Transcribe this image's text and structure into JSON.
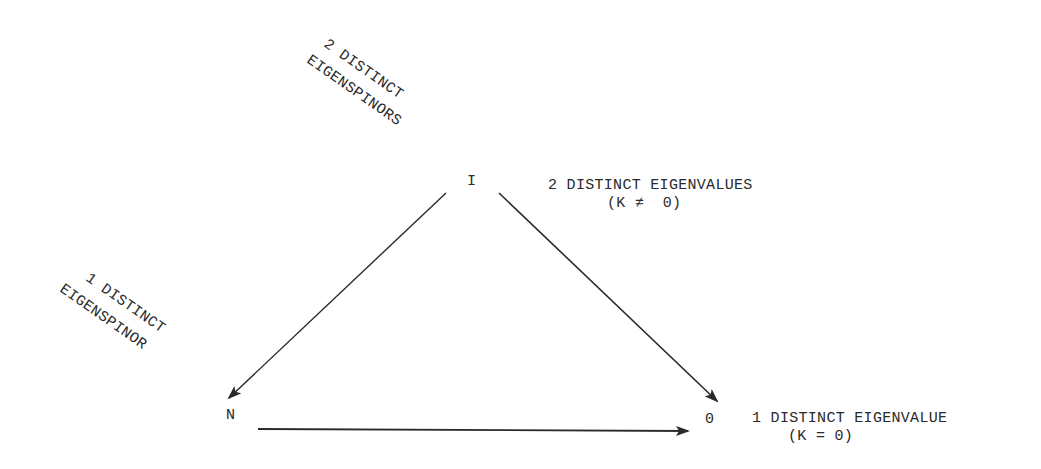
{
  "diagram": {
    "nodes": [
      {
        "id": "I",
        "label": "I"
      },
      {
        "id": "N",
        "label": "N"
      },
      {
        "id": "O",
        "label": "0"
      }
    ],
    "edges": [
      {
        "from": "I",
        "to": "N"
      },
      {
        "from": "I",
        "to": "O"
      },
      {
        "from": "N",
        "to": "O"
      }
    ],
    "labels": {
      "two_eigenspinors_line1": "2 DISTINCT",
      "two_eigenspinors_line2": "EIGENSPINORS",
      "one_eigenspinor_line1": "1 DISTINCT",
      "one_eigenspinor_line2": "EIGENSPINOR",
      "two_eigenvalues_line1": "2 DISTINCT EIGENVALUES",
      "two_eigenvalues_line2": "(K ≠  0)",
      "one_eigenvalue_line1": "1 DISTINCT EIGENVALUE",
      "one_eigenvalue_line2": "(K = 0)"
    },
    "colors": {
      "ink": "#2a2a2a",
      "background": "#ffffff"
    }
  }
}
